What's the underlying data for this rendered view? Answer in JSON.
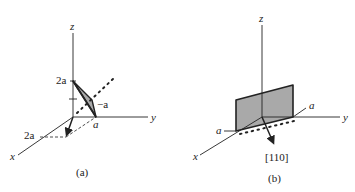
{
  "panels": [
    {
      "id": "a",
      "caption": "(a)",
      "axes": {
        "x": "x",
        "y": "y",
        "z": "z"
      },
      "intercept_labels": {
        "z": "2a",
        "x": "2a",
        "y": "a",
        "neg": "−a"
      },
      "description": "Shaded triangular plane with intercepts 2a on x, a on y, 2a on z; normal-direction arrow from origin toward x; dotted line in plane direction"
    },
    {
      "id": "b",
      "caption": "(b)",
      "axes": {
        "x": "x",
        "y": "y",
        "z": "z"
      },
      "intercept_labels": {
        "x": "a",
        "y": "a"
      },
      "direction_label": "[110]",
      "description": "Shaded vertical rectangular plane intersecting x and y axes at a; [110] direction arrow from origin"
    }
  ],
  "colors": {
    "line": "#222222",
    "plane_fill": "#a9a9a9",
    "background": "#ffffff"
  }
}
